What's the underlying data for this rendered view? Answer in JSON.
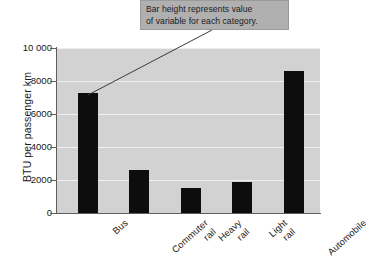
{
  "chart_data": {
    "type": "bar",
    "title": "",
    "xlabel": "",
    "ylabel": "BTU per passenger km",
    "categories": [
      "Bus",
      "Commuter rail",
      "Heavy rail",
      "Light rail",
      "Automobile"
    ],
    "values": [
      7270,
      2600,
      1500,
      1880,
      8600
    ],
    "ylim": [
      0,
      10000
    ],
    "yticks": [
      0,
      2000,
      4000,
      6000,
      8000,
      10000
    ],
    "ytick_labels": [
      "0",
      "2000",
      "4000",
      "6000",
      "8000",
      "10 000"
    ],
    "grid": true,
    "legend": false,
    "bar_color": "#0d0d0d",
    "plot_background": "#d2d2d2",
    "gridline_color": "#efefef",
    "annotations": [
      {
        "name": "bar-height-callout",
        "lines": [
          "Bar height represents value",
          "of variable for each category."
        ],
        "points_to": "Bus"
      }
    ]
  },
  "axis": {
    "y_title": "BTU per passenger km",
    "ticks": [
      {
        "label": "10 000",
        "value": 10000
      },
      {
        "label": "8000",
        "value": 8000
      },
      {
        "label": "6000",
        "value": 6000
      },
      {
        "label": "4000",
        "value": 4000
      },
      {
        "label": "2000",
        "value": 2000
      },
      {
        "label": "0",
        "value": 0
      }
    ]
  },
  "categories": [
    {
      "line1": "Bus",
      "line2": ""
    },
    {
      "line1": "Commuter",
      "line2": "rail"
    },
    {
      "line1": "Heavy",
      "line2": "rail"
    },
    {
      "line1": "Light",
      "line2": "rail"
    },
    {
      "line1": "Automobile",
      "line2": ""
    }
  ],
  "callout": {
    "line1": "Bar height represents value",
    "line2": "of variable for each category."
  }
}
